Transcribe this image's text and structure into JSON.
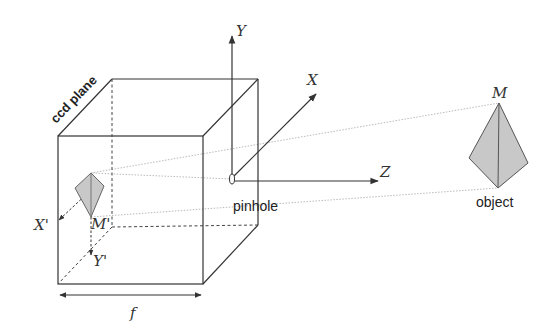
{
  "diagram": {
    "labels": {
      "ccd_plane": "ccd plane",
      "axis_y": "Y",
      "axis_x": "X",
      "axis_z": "Z",
      "image_x": "X'",
      "image_y": "Y'",
      "image_point": "M'",
      "object_point": "M",
      "pinhole": "pinhole",
      "object": "object",
      "focal_length": "f"
    },
    "colors": {
      "line": "#333333",
      "ray": "#bbbbbb",
      "fill": "#c8c8c8"
    }
  }
}
